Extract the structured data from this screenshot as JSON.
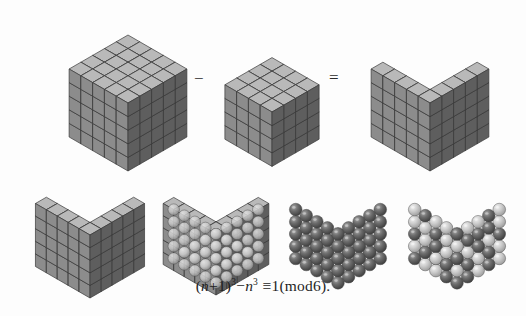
{
  "figure": {
    "background_color": "#fdfdfd",
    "caption_formula": "(n+1)³−n³≡1(mod6).",
    "formula_parts": {
      "open_paren": "(",
      "var_n": "n",
      "plus_one": "+1",
      "close_paren": ")",
      "exp_three_a": "3",
      "minus": "−",
      "var_n2": "n",
      "exp_three_b": "3",
      "equiv": "≡",
      "one": "1",
      "mod_open": "(",
      "mod_text": "mod6",
      "mod_close": ")",
      "period": "."
    },
    "operators": {
      "minus_sign": "−",
      "equals_sign": "="
    },
    "colors": {
      "cube_top_face": "#b9b9b9",
      "cube_left_face": "#8c8c8c",
      "cube_right_face": "#5e5e5e",
      "cube_floor_face": "#c4c4c4",
      "edge_stroke": "#3a3a3a",
      "sphere_dark": "#5a5a5a",
      "sphere_light": "#bdbdbd",
      "sphere_highlight": "#e6e6e6",
      "text_color": "#1f1f1f"
    },
    "panels": [
      {
        "id": "big-cube",
        "label": "Solid cube of side n+1",
        "shape": "solid-cube",
        "side": 5,
        "row": "top",
        "order": 1,
        "cell_count": 125
      },
      {
        "id": "small-cube",
        "label": "Solid cube of side n",
        "shape": "solid-cube",
        "side": 4,
        "row": "top",
        "order": 2,
        "cell_count": 64
      },
      {
        "id": "corner-shell-top",
        "label": "Corner shell remainder",
        "shape": "corner-shell",
        "side": 5,
        "row": "top",
        "order": 3,
        "cell_count": 61
      },
      {
        "id": "corner-shell-bottom",
        "label": "Corner shell remainder repeated",
        "shape": "corner-shell",
        "side": 5,
        "row": "bottom",
        "order": 1,
        "cell_count": 61
      },
      {
        "id": "shell-with-spheres",
        "label": "Corner shell with inscribed spheres",
        "shape": "corner-shell-spheres",
        "side": 5,
        "row": "bottom",
        "order": 2,
        "cell_count": 61
      },
      {
        "id": "sphere-pack-dark",
        "label": "Sphere packing all dark",
        "shape": "sphere-pack",
        "side": 5,
        "row": "bottom",
        "order": 3,
        "sphere_count": 61,
        "coloring": "uniform"
      },
      {
        "id": "sphere-pack-two-tone",
        "label": "Sphere packing grouped into sixes plus one",
        "shape": "sphere-pack",
        "side": 5,
        "row": "bottom",
        "order": 4,
        "sphere_count": 61,
        "coloring": "two-tone"
      }
    ]
  }
}
